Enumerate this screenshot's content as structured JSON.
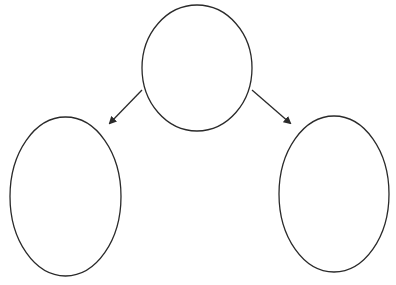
{
  "diagram": {
    "type": "tree",
    "stroke_color": "#2a2a2a",
    "background": "#ffffff",
    "nodes": [
      {
        "id": "parent",
        "label": "",
        "shape": "ellipse",
        "cx": 197,
        "cy": 68,
        "rx": 55,
        "ry": 63
      },
      {
        "id": "left-child",
        "label": "",
        "shape": "ellipse",
        "cx": 65.5,
        "cy": 196.5,
        "rx": 55.5,
        "ry": 79.5
      },
      {
        "id": "right-child",
        "label": "",
        "shape": "ellipse",
        "cx": 334,
        "cy": 194,
        "rx": 55,
        "ry": 78
      }
    ],
    "edges": [
      {
        "from": "parent",
        "to": "left-child",
        "x1": 142,
        "y1": 90,
        "x2": 110,
        "y2": 123
      },
      {
        "from": "parent",
        "to": "right-child",
        "x1": 252,
        "y1": 90,
        "x2": 290,
        "y2": 123
      }
    ]
  }
}
